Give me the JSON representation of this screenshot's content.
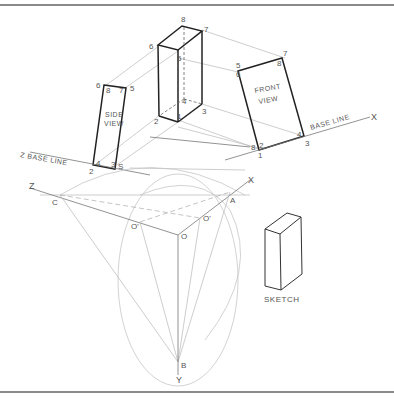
{
  "figure": {
    "labels": {
      "side_view": [
        "SIDE",
        "VIEW"
      ],
      "front_view": [
        "FRONT",
        "VIEW"
      ],
      "base_line_left": "Z  BASE LINE",
      "base_line_right": "BASE LINE",
      "sketch": "SKETCH"
    },
    "axes": {
      "x": "X",
      "y": "Y",
      "z": "Z"
    },
    "points": {
      "a": "A",
      "b": "B",
      "c": "C",
      "o": "O",
      "o1": "O'",
      "o2": "O'"
    },
    "box_vertices": [
      "1",
      "2",
      "3",
      "4",
      "5",
      "6",
      "7",
      "8"
    ],
    "side_view_vertices": [
      "6",
      "8",
      "7",
      "5",
      "4",
      "2",
      "3",
      "S"
    ],
    "front_view_vertices": [
      "5",
      "6",
      "7",
      "8",
      "4",
      "3",
      "2",
      "1"
    ]
  }
}
